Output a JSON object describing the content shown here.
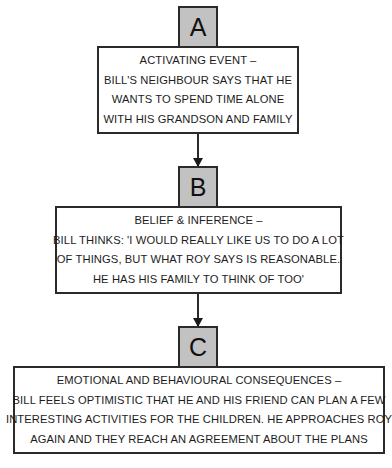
{
  "diagram": {
    "type": "ABC flowchart",
    "steps": [
      {
        "label": "A",
        "lines": [
          "ACTIVATING EVENT –",
          "BILL'S NEIGHBOUR SAYS THAT HE",
          "WANTS TO SPEND TIME ALONE",
          "WITH HIS GRANDSON AND FAMILY"
        ]
      },
      {
        "label": "B",
        "lines": [
          "BELIEF & INFERENCE –",
          "BILL THINKS: 'I WOULD REALLY LIKE US TO DO A LOT",
          "OF THINGS, BUT WHAT ROY SAYS IS REASONABLE.",
          "HE HAS HIS FAMILY TO THINK OF TOO'"
        ]
      },
      {
        "label": "C",
        "lines": [
          "EMOTIONAL AND BEHAVIOURAL CONSEQUENCES –",
          "BILL FEELS OPTIMISTIC THAT HE AND HIS FRIEND CAN PLAN A FEW",
          "INTERESTING ACTIVITIES FOR THE CHILDREN. HE APPROACHES ROY",
          "AGAIN AND THEY REACH AN AGREEMENT ABOUT THE PLANS"
        ]
      }
    ],
    "colors": {
      "label_fill": "#c2c2c2",
      "border": "#2a2a2a",
      "background": "#ffffff"
    }
  }
}
